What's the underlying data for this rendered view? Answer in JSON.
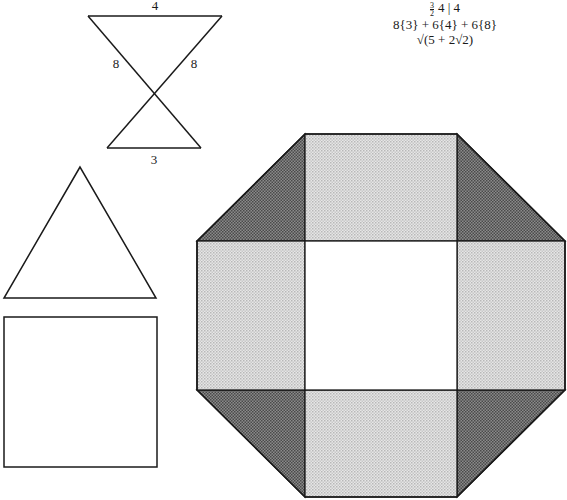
{
  "figure": {
    "formula": {
      "symbol_fraction_num": "3",
      "symbol_fraction_den": "2",
      "symbol_rest": "4 | 4",
      "faces": "8{3} + 6{4} + 6{8}",
      "circumradius": "√(5 + 2√2)"
    },
    "hourglass": {
      "top_label": "4",
      "left_label": "8",
      "right_label": "8",
      "bottom_label": "3"
    },
    "faces_shown": [
      "triangle",
      "square",
      "octagon"
    ],
    "colors": {
      "stroke": "#1a1a1a",
      "dark_fill": "#6e6e6e",
      "light_fill": "#cfcfcf",
      "center_fill": "#ffffff"
    }
  }
}
